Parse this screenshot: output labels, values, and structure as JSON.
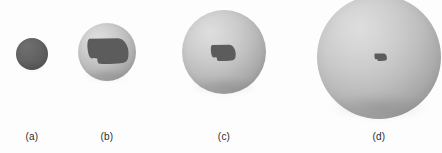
{
  "figure": {
    "name": "sphere-projection-series",
    "background_color": "#fdfdfd",
    "width": 442,
    "height": 153,
    "sphere_color_light": "#d6d6d6",
    "sphere_color_dark": "#8e8e8e",
    "overlay_color": "#5c5c5c",
    "overlay_shape_name": "nebraska-state-outline",
    "caption_color": "#2b2b2b"
  },
  "panels": [
    {
      "id": "a",
      "label": "(a)",
      "sphere": {
        "center_x": 32,
        "center_y": 54,
        "radius": 16,
        "diameter": 32
      },
      "overlay": {
        "name": "nebraska-state-outline",
        "relative_size": 1.0,
        "center_x": 32,
        "center_y": 54,
        "width": 31,
        "height": 27,
        "fully_covers_sphere": true
      },
      "caption_x": 32,
      "caption_y": 131
    },
    {
      "id": "b",
      "label": "(b)",
      "sphere": {
        "center_x": 107,
        "center_y": 52,
        "radius": 29,
        "diameter": 58
      },
      "overlay": {
        "name": "nebraska-state-outline",
        "relative_size": 0.62,
        "center_x": 107,
        "center_y": 50,
        "width": 43,
        "height": 27,
        "fully_covers_sphere": false
      },
      "caption_x": 107,
      "caption_y": 131
    },
    {
      "id": "c",
      "label": "(c)",
      "sphere": {
        "center_x": 224,
        "center_y": 52,
        "radius": 42,
        "diameter": 84
      },
      "overlay": {
        "name": "nebraska-state-outline",
        "relative_size": 0.26,
        "center_x": 223,
        "center_y": 52,
        "width": 26,
        "height": 17,
        "fully_covers_sphere": false
      },
      "caption_x": 224,
      "caption_y": 131
    },
    {
      "id": "d",
      "label": "(d)",
      "sphere": {
        "center_x": 379,
        "center_y": 57,
        "radius": 62,
        "diameter": 124
      },
      "overlay": {
        "name": "nebraska-state-outline",
        "relative_size": 0.09,
        "center_x": 380,
        "center_y": 57,
        "width": 13,
        "height": 8,
        "fully_covers_sphere": false
      },
      "caption_x": 379,
      "caption_y": 131
    }
  ]
}
